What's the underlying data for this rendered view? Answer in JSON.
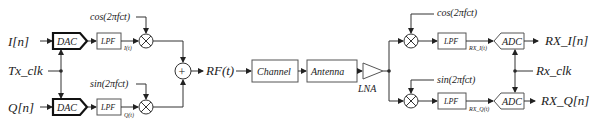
{
  "tx": {
    "inputs": {
      "i": "I[n]",
      "q": "Q[n]"
    },
    "clock": "Tx_clk",
    "dac_label": "DAC",
    "lpf_label": "LPF",
    "baseband_i": "I(t)",
    "baseband_q": "Q(t)",
    "carrier_cos": "cos(2πfᴄt)",
    "carrier_sin": "sin(2πfᴄt)",
    "sum_symbol": "+",
    "output": "RF(t)"
  },
  "channel": {
    "channel_label": "Channel",
    "antenna_label": "Antenna",
    "lna_label": "LNA"
  },
  "rx": {
    "carrier_cos": "cos(2πfᴄt)",
    "carrier_sin": "sin(2πfᴄt)",
    "lpf_label": "LPF",
    "adc_label": "ADC",
    "baseband_i": "RX_I(t)",
    "baseband_q": "RX_Q(t)",
    "clock": "Rx_clk",
    "outputs": {
      "i": "RX_I[n]",
      "q": "RX_Q[n]"
    }
  }
}
